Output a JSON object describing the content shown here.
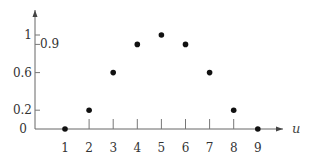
{
  "chart_data": {
    "type": "scatter",
    "title": "",
    "xlabel": "u",
    "ylabel": "",
    "x": [
      1,
      2,
      3,
      4,
      5,
      6,
      7,
      8,
      9
    ],
    "series": [
      {
        "name": "points",
        "values": [
          0,
          0.2,
          0.6,
          0.9,
          1,
          0.9,
          0.6,
          0.2,
          0
        ]
      }
    ],
    "x_ticks": [
      "1",
      "2",
      "3",
      "4",
      "5",
      "6",
      "7",
      "8",
      "9"
    ],
    "y_ticks": [
      {
        "value": 0,
        "label": "0",
        "side": "left"
      },
      {
        "value": 0.2,
        "label": "0.2",
        "side": "left"
      },
      {
        "value": 0.6,
        "label": "0.6",
        "side": "left"
      },
      {
        "value": 0.9,
        "label": "0.9",
        "side": "right"
      },
      {
        "value": 1,
        "label": "1",
        "side": "left"
      }
    ],
    "xlim": [
      0,
      10
    ],
    "ylim": [
      0,
      1.1
    ],
    "grid": false,
    "legend": "none",
    "colors": {
      "axis": "#666666",
      "point": "#111111"
    }
  }
}
